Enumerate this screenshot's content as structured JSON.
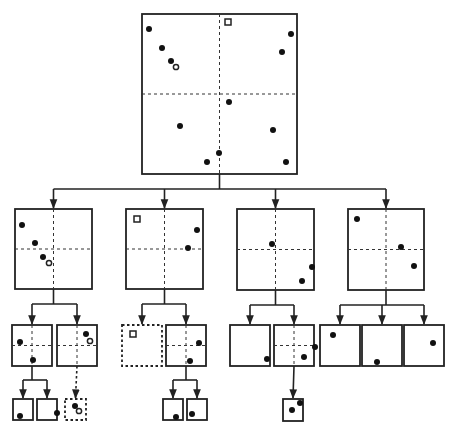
{
  "diagram": {
    "title": "",
    "type": "quadtree",
    "colors": {
      "stroke": "#222222",
      "point": "#111111",
      "background": "#ffffff"
    },
    "nodes": [
      {
        "id": "root",
        "x": 142,
        "y": 14,
        "w": 155,
        "h": 160,
        "split": true,
        "dotted": false,
        "points": [
          {
            "x": 149,
            "y": 29,
            "t": "dot"
          },
          {
            "x": 162,
            "y": 48,
            "t": "dot"
          },
          {
            "x": 171,
            "y": 61,
            "t": "dot"
          },
          {
            "x": 176,
            "y": 67,
            "t": "ring"
          },
          {
            "x": 228,
            "y": 22,
            "t": "square"
          },
          {
            "x": 291,
            "y": 34,
            "t": "dot"
          },
          {
            "x": 282,
            "y": 52,
            "t": "dot"
          },
          {
            "x": 229,
            "y": 102,
            "t": "dot"
          },
          {
            "x": 180,
            "y": 126,
            "t": "dot"
          },
          {
            "x": 273,
            "y": 130,
            "t": "dot"
          },
          {
            "x": 219,
            "y": 153,
            "t": "dot"
          },
          {
            "x": 207,
            "y": 162,
            "t": "dot"
          },
          {
            "x": 286,
            "y": 162,
            "t": "dot"
          }
        ]
      },
      {
        "id": "n1",
        "x": 15,
        "y": 209,
        "w": 77,
        "h": 80,
        "split": true,
        "dotted": false,
        "points": [
          {
            "x": 22,
            "y": 225,
            "t": "dot"
          },
          {
            "x": 35,
            "y": 243,
            "t": "dot"
          },
          {
            "x": 43,
            "y": 257,
            "t": "dot"
          },
          {
            "x": 49,
            "y": 263,
            "t": "ring"
          }
        ]
      },
      {
        "id": "n2",
        "x": 126,
        "y": 209,
        "w": 77,
        "h": 80,
        "split": true,
        "dotted": false,
        "points": [
          {
            "x": 137,
            "y": 219,
            "t": "square"
          },
          {
            "x": 197,
            "y": 230,
            "t": "dot"
          },
          {
            "x": 188,
            "y": 248,
            "t": "dot"
          }
        ]
      },
      {
        "id": "n3",
        "x": 237,
        "y": 209,
        "w": 77,
        "h": 81,
        "split": true,
        "dotted": false,
        "points": [
          {
            "x": 272,
            "y": 244,
            "t": "dot"
          },
          {
            "x": 312,
            "y": 267,
            "t": "dot"
          },
          {
            "x": 302,
            "y": 281,
            "t": "dot"
          }
        ]
      },
      {
        "id": "n4",
        "x": 348,
        "y": 209,
        "w": 76,
        "h": 81,
        "split": true,
        "dotted": false,
        "points": [
          {
            "x": 357,
            "y": 219,
            "t": "dot"
          },
          {
            "x": 401,
            "y": 247,
            "t": "dot"
          },
          {
            "x": 414,
            "y": 266,
            "t": "dot"
          }
        ]
      },
      {
        "id": "n11",
        "x": 12,
        "y": 325,
        "w": 40,
        "h": 41,
        "split": true,
        "dotted": false,
        "points": [
          {
            "x": 20,
            "y": 342,
            "t": "dot"
          },
          {
            "x": 33,
            "y": 360,
            "t": "dot"
          }
        ]
      },
      {
        "id": "n12",
        "x": 57,
        "y": 325,
        "w": 40,
        "h": 41,
        "split": true,
        "dotted": false,
        "points": [
          {
            "x": 86,
            "y": 334,
            "t": "dot"
          },
          {
            "x": 90,
            "y": 341,
            "t": "ring"
          }
        ]
      },
      {
        "id": "n21",
        "x": 122,
        "y": 325,
        "w": 40,
        "h": 41,
        "split": false,
        "dotted": true,
        "points": [
          {
            "x": 133,
            "y": 334,
            "t": "square"
          }
        ]
      },
      {
        "id": "n22",
        "x": 166,
        "y": 325,
        "w": 40,
        "h": 41,
        "split": true,
        "dotted": false,
        "points": [
          {
            "x": 199,
            "y": 343,
            "t": "dot"
          },
          {
            "x": 190,
            "y": 361,
            "t": "dot"
          }
        ]
      },
      {
        "id": "n31",
        "x": 230,
        "y": 325,
        "w": 40,
        "h": 41,
        "split": false,
        "dotted": false,
        "points": [
          {
            "x": 267,
            "y": 359,
            "t": "dot"
          }
        ]
      },
      {
        "id": "n32",
        "x": 274,
        "y": 325,
        "w": 40,
        "h": 41,
        "split": true,
        "dotted": false,
        "points": [
          {
            "x": 315,
            "y": 347,
            "t": "dot"
          },
          {
            "x": 304,
            "y": 357,
            "t": "dot"
          }
        ]
      },
      {
        "id": "n41",
        "x": 320,
        "y": 325,
        "w": 40,
        "h": 41,
        "split": false,
        "dotted": false,
        "points": [
          {
            "x": 333,
            "y": 335,
            "t": "dot"
          }
        ]
      },
      {
        "id": "n42",
        "x": 362,
        "y": 325,
        "w": 40,
        "h": 41,
        "split": false,
        "dotted": false,
        "points": [
          {
            "x": 377,
            "y": 362,
            "t": "dot"
          }
        ]
      },
      {
        "id": "n43",
        "x": 404,
        "y": 325,
        "w": 40,
        "h": 41,
        "split": false,
        "dotted": false,
        "points": [
          {
            "x": 433,
            "y": 343,
            "t": "dot"
          }
        ]
      },
      {
        "id": "n111",
        "x": 13,
        "y": 399,
        "w": 20,
        "h": 21,
        "split": false,
        "dotted": false,
        "points": [
          {
            "x": 20,
            "y": 416,
            "t": "dot"
          }
        ]
      },
      {
        "id": "n112",
        "x": 37,
        "y": 399,
        "w": 20,
        "h": 21,
        "split": false,
        "dotted": false,
        "points": [
          {
            "x": 57,
            "y": 413,
            "t": "dot"
          }
        ]
      },
      {
        "id": "n121",
        "x": 65,
        "y": 399,
        "w": 21,
        "h": 21,
        "split": false,
        "dotted": true,
        "points": [
          {
            "x": 75,
            "y": 406,
            "t": "dot"
          },
          {
            "x": 79,
            "y": 411,
            "t": "ring"
          }
        ]
      },
      {
        "id": "n221",
        "x": 163,
        "y": 399,
        "w": 20,
        "h": 21,
        "split": false,
        "dotted": false,
        "points": [
          {
            "x": 176,
            "y": 417,
            "t": "dot"
          }
        ]
      },
      {
        "id": "n222",
        "x": 187,
        "y": 399,
        "w": 20,
        "h": 21,
        "split": false,
        "dotted": false,
        "points": [
          {
            "x": 192,
            "y": 414,
            "t": "dot"
          }
        ]
      },
      {
        "id": "n321",
        "x": 283,
        "y": 399,
        "w": 20,
        "h": 22,
        "split": false,
        "dotted": false,
        "points": [
          {
            "x": 292,
            "y": 410,
            "t": "dot"
          },
          {
            "x": 300,
            "y": 403,
            "t": "dot"
          }
        ]
      }
    ],
    "edges": [
      {
        "from": "root",
        "children": [
          "n1",
          "n2",
          "n3",
          "n4"
        ],
        "dotted": false
      },
      {
        "from": "n1",
        "children": [
          "n11",
          "n12"
        ],
        "dotted": false
      },
      {
        "from": "n2",
        "children": [
          "n21",
          "n22"
        ],
        "dotted": false
      },
      {
        "from": "n3",
        "children": [
          "n31",
          "n32"
        ],
        "dotted": false
      },
      {
        "from": "n4",
        "children": [
          "n41",
          "n42",
          "n43"
        ],
        "dotted": false
      },
      {
        "from": "n11",
        "children": [
          "n111",
          "n112"
        ],
        "dotted": false
      },
      {
        "from": "n12",
        "children": [
          "n121"
        ],
        "dotted": true
      },
      {
        "from": "n22",
        "children": [
          "n221",
          "n222"
        ],
        "dotted": false
      },
      {
        "from": "n32",
        "children": [
          "n321"
        ],
        "dotted": false
      }
    ]
  }
}
